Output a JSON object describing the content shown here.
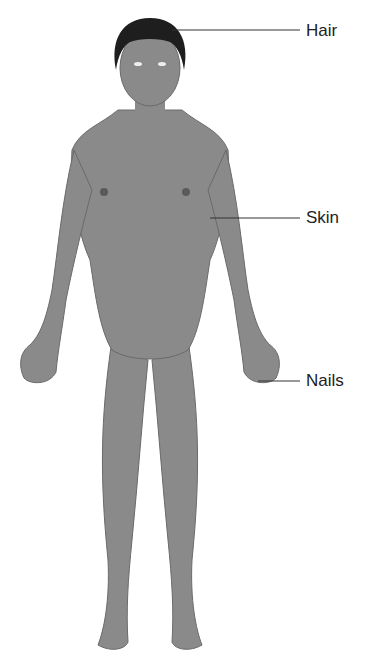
{
  "diagram": {
    "labels": [
      {
        "id": "hair",
        "text": "Hair",
        "x": 306,
        "y": 22,
        "line": [
          172,
          30,
          300,
          30
        ]
      },
      {
        "id": "skin",
        "text": "Skin",
        "x": 306,
        "y": 209,
        "line": [
          210,
          218,
          300,
          218
        ]
      },
      {
        "id": "nails",
        "text": "Nails",
        "x": 306,
        "y": 372,
        "line": [
          258,
          381,
          300,
          381
        ]
      }
    ],
    "colors": {
      "body": "#8a8a8a",
      "hair": "#1e1e1e",
      "line": "#333333",
      "text": "#222222"
    }
  }
}
